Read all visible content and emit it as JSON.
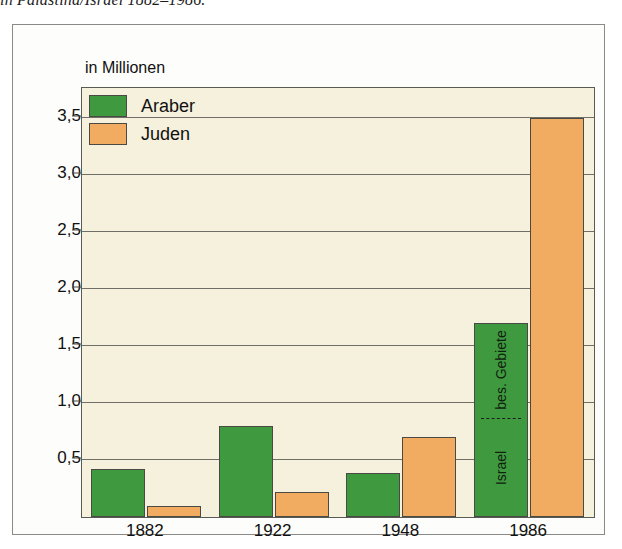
{
  "caption": "in Palästina/Israel 1882–1986.",
  "axis_unit": "in Millionen",
  "legend": {
    "items": [
      {
        "label": "Araber",
        "color": "#3f9a3f",
        "swatch": "araber-swatch"
      },
      {
        "label": "Juden",
        "color": "#f2ac62",
        "swatch": "juden-swatch"
      }
    ]
  },
  "annotations": {
    "upper_segment": "bes. Gebiete",
    "lower_segment": "Israel"
  },
  "colors": {
    "araber": "#3f9a3f",
    "juden": "#f2ac62",
    "plot_background": "#f6f1dd",
    "frame_background": "#fdfdfb",
    "axis": "#4a4a45",
    "gridline": "#6f6f68"
  },
  "chart_data": {
    "type": "bar",
    "title": "in Palästina/Israel 1882–1986.",
    "subtitle": "",
    "xlabel": "",
    "ylabel": "in Millionen",
    "ylim": [
      0,
      3.75
    ],
    "yticks": [
      0.5,
      1.0,
      1.5,
      2.0,
      2.5,
      3.0,
      3.5
    ],
    "ytick_labels": [
      "0,5",
      "1,0",
      "1,5",
      "2,0",
      "2,5",
      "3,0",
      "3,5"
    ],
    "grid": true,
    "legend_position": "top-left",
    "categories": [
      "1882",
      "1922",
      "1948",
      "1986"
    ],
    "series": [
      {
        "name": "Araber",
        "color": "#3f9a3f",
        "values": [
          0.42,
          0.8,
          0.39,
          1.7
        ]
      },
      {
        "name": "Juden",
        "color": "#f2ac62",
        "values": [
          0.1,
          0.22,
          0.7,
          3.5
        ]
      }
    ],
    "segment_annotations": [
      {
        "series": "Araber",
        "category": "1986",
        "split_value": 0.85,
        "lower_label": "Israel",
        "upper_label": "bes. Gebiete"
      }
    ]
  }
}
